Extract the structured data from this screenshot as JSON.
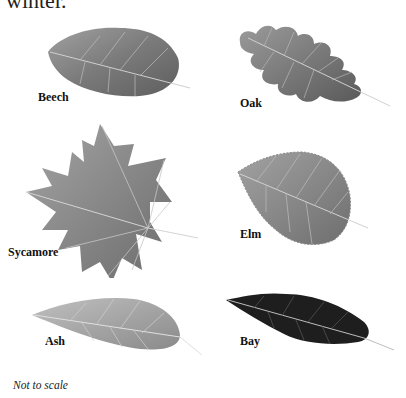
{
  "heading": "winter.",
  "leaves": [
    {
      "name": "Beech",
      "tone": "#8a8a8a"
    },
    {
      "name": "Oak",
      "tone": "#7e7e7e"
    },
    {
      "name": "Sycamore",
      "tone": "#8c8c8c"
    },
    {
      "name": "Elm",
      "tone": "#8f8f8f"
    },
    {
      "name": "Ash",
      "tone": "#a6a6a6"
    },
    {
      "name": "Bay",
      "tone": "#1c1c1c"
    }
  ],
  "note": "Not to scale"
}
